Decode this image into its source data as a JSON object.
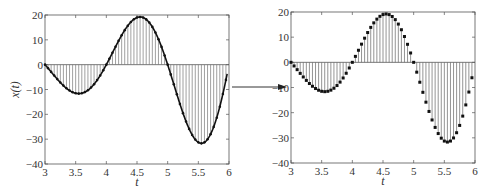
{
  "chart_data": [
    {
      "type": "line",
      "title": "",
      "description": "Continuous signal with sampled stems (curve + dots)",
      "xlabel": "t",
      "ylabel": "x(t)",
      "xlim": [
        3,
        6
      ],
      "ylim": [
        -40,
        20
      ],
      "xticks": [
        "3",
        "3.5",
        "4",
        "4.5",
        "5",
        "5.5",
        "6"
      ],
      "yticks": [
        "20",
        "10",
        "0",
        "-10",
        "-20",
        "-30",
        "-40"
      ],
      "grid": false,
      "style": "curve-with-stems"
    },
    {
      "type": "stem",
      "title": "",
      "description": "Discrete samples of the signal",
      "xlabel": "t",
      "ylabel": "",
      "xlim": [
        3,
        6
      ],
      "ylim": [
        -40,
        20
      ],
      "xticks": [
        "3",
        "3.5",
        "4",
        "4.5",
        "5",
        "5.5",
        "6"
      ],
      "yticks": [
        "20",
        "10",
        "0",
        "-10",
        "-20",
        "-30",
        "-40"
      ],
      "grid": false,
      "style": "stem"
    }
  ],
  "samples": {
    "t_start": 3,
    "t_step": 0.05,
    "values": [
      0,
      -1.44,
      -2.91,
      -4.39,
      -5.82,
      -7.18,
      -8.42,
      -9.51,
      -10.41,
      -11.09,
      -11.51,
      -11.66,
      -11.51,
      -11.05,
      -10.29,
      -9.22,
      -7.86,
      -6.22,
      -4.34,
      -2.25,
      0,
      2.37,
      4.8,
      7.23,
      9.6,
      11.84,
      13.89,
      15.69,
      17.17,
      18.28,
      18.98,
      19.22,
      18.97,
      18.22,
      16.97,
      15.2,
      12.96,
      10.26,
      7.16,
      3.72,
      0,
      -3.91,
      -7.91,
      -11.92,
      -15.83,
      -19.52,
      -22.9,
      -25.86,
      -28.3,
      -30.14,
      -31.29,
      -31.68,
      -31.28,
      -30.05,
      -27.97,
      -25.07,
      -21.37,
      -16.92,
      -11.81,
      -6.13
    ]
  },
  "arrow": {
    "direction": "right",
    "meaning": "sampling"
  }
}
